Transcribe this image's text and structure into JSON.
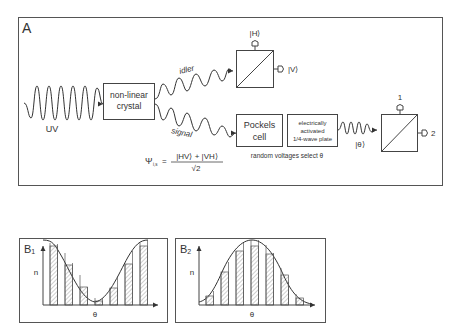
{
  "panel_a": {
    "label": "A",
    "source_label": "UV",
    "crystal_label_line1": "non-linear",
    "crystal_label_line2": "crystal",
    "idler_label": "idler",
    "signal_label": "signal",
    "pbs1_top_label": "|H⟩",
    "pbs1_right_label": "|V⟩",
    "pockels_line1": "Pockels",
    "pockels_line2": "cell",
    "waveplate_line1": "electrically",
    "waveplate_line2": "activated",
    "waveplate_line3": "1/4-wave plate",
    "random_voltages_text": "random voltages select θ",
    "theta_state_label": "|θ⟩",
    "pbs2_top_label": "1",
    "pbs2_right_label": "2",
    "equation_lhs": "Ψ",
    "equation_sub": "i,s",
    "equation_eq": "=",
    "equation_num": "|HV⟩ + |VH⟩",
    "equation_den": "√2"
  },
  "panel_b1": {
    "label": "B",
    "subscript": "1",
    "ylabel": "n",
    "xlabel": "θ"
  },
  "panel_b2": {
    "label": "B",
    "subscript": "2",
    "ylabel": "n",
    "xlabel": "θ"
  },
  "colors": {
    "line": "#333333",
    "frame": "#555555",
    "hatch": "#777777",
    "background": "#ffffff"
  }
}
